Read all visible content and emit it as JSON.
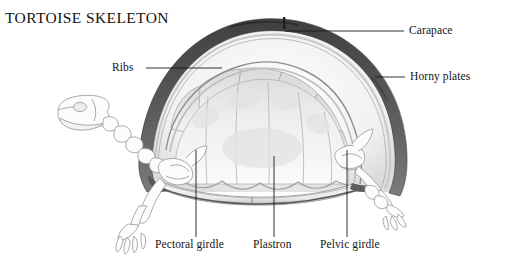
{
  "figure": {
    "title": "TORTOISE SKELETON",
    "background_color": "#ffffff"
  },
  "colors": {
    "ink": "#141414",
    "leader_line": "#1a1a1a",
    "carapace_rim_dark": "#4a4a4a",
    "carapace_rim_mid": "#6e6e6e",
    "shell_interior_light": "#f2f2f2",
    "shell_interior_shade": "#e2e2e2",
    "bone_outline": "#9a9a9a",
    "bone_fill": "#fbfbfb",
    "plastron_shadow": "#5a5a5a"
  },
  "labels": [
    {
      "id": "ribs",
      "text": "Ribs",
      "side": "left",
      "target": "rib-segments"
    },
    {
      "id": "carapace",
      "text": "Carapace",
      "side": "right",
      "target": "carapace-apex"
    },
    {
      "id": "horny",
      "text": "Horny plates",
      "side": "right",
      "target": "horny-plates-edge"
    },
    {
      "id": "pectoral",
      "text": "Pectoral girdle",
      "side": "bottom",
      "target": "pectoral-girdle"
    },
    {
      "id": "plastron",
      "text": "Plastron",
      "side": "bottom",
      "target": "plastron"
    },
    {
      "id": "pelvic",
      "text": "Pelvic girdle",
      "side": "bottom",
      "target": "pelvic-girdle"
    }
  ],
  "leader_lines": [
    {
      "id": "ribs",
      "x1": 146,
      "y1": 68,
      "x2": 222,
      "y2": 68
    },
    {
      "id": "carapace",
      "x1": 285,
      "y1": 31,
      "x2": 404,
      "y2": 31
    },
    {
      "id": "horny",
      "x1": 375,
      "y1": 77,
      "x2": 405,
      "y2": 77
    },
    {
      "id": "pectoral",
      "x1": 196,
      "y1": 150,
      "x2": 196,
      "y2": 237
    },
    {
      "id": "plastron",
      "x1": 274,
      "y1": 156,
      "x2": 274,
      "y2": 237
    },
    {
      "id": "pelvic",
      "x1": 347,
      "y1": 150,
      "x2": 347,
      "y2": 237
    }
  ]
}
